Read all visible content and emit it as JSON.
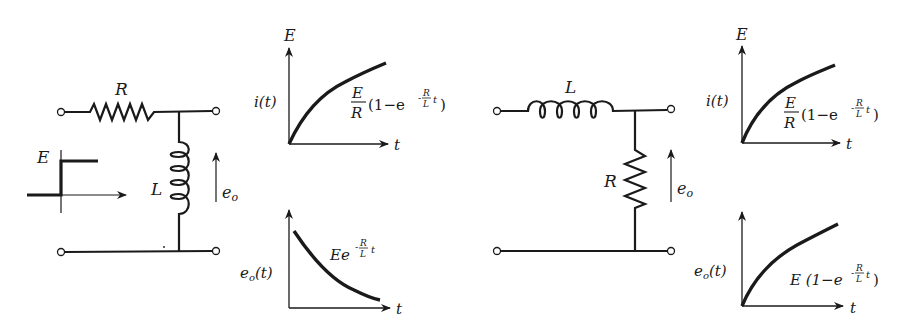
{
  "circuits": [
    {
      "id": "rl-inductor-output",
      "series_element": "R",
      "shunt_element": "L",
      "output_label": "e",
      "output_sub": "o",
      "input_step_label": "E",
      "graphs": {
        "current": {
          "y_label": "i(t)",
          "y_top_label": "E",
          "x_label": "t",
          "formula_num": "E",
          "formula_den": "R",
          "formula_rest": "(1−e",
          "formula_exp_num": "R",
          "formula_exp_den": "L",
          "formula_exp_t": "t",
          "formula_close": ")"
        },
        "voltage": {
          "y_label": "e",
          "y_sub": "o",
          "y_arg": "(t)",
          "x_label": "t",
          "formula_base": "Ee",
          "formula_exp_num": "R",
          "formula_exp_den": "L",
          "formula_exp_t": "t"
        }
      }
    },
    {
      "id": "rl-resistor-output",
      "series_element": "L",
      "shunt_element": "R",
      "output_label": "e",
      "output_sub": "o",
      "graphs": {
        "current": {
          "y_label": "i(t)",
          "y_top_label": "E",
          "x_label": "t",
          "formula_num": "E",
          "formula_den": "R",
          "formula_rest": "(1−e",
          "formula_exp_num": "R",
          "formula_exp_den": "L",
          "formula_exp_t": "t",
          "formula_close": ")"
        },
        "voltage": {
          "y_label": "e",
          "y_sub": "o",
          "y_arg": "(t)",
          "x_label": "t",
          "formula_base": "E (1−e",
          "formula_exp_num": "R",
          "formula_exp_den": "L",
          "formula_exp_t": "t",
          "formula_close": ")"
        }
      }
    }
  ],
  "colors": {
    "ink": "#1a1a1a",
    "background": "#ffffff"
  }
}
